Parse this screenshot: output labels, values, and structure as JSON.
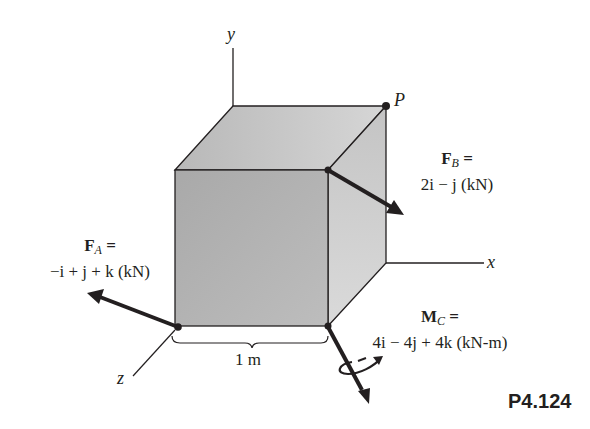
{
  "figure": {
    "label": "P4.124",
    "axes": {
      "y": "y",
      "x": "x",
      "z": "z"
    },
    "point_P": "P",
    "dimension": "1 m",
    "forces": [
      {
        "id": "F_A",
        "name": "F",
        "subscript": "A",
        "equals": "=",
        "expression": "−i + j + k (kN)"
      },
      {
        "id": "F_B",
        "name": "F",
        "subscript": "B",
        "equals": "=",
        "expression": "2i − j (kN)"
      }
    ],
    "moment": {
      "id": "M_C",
      "name": "M",
      "subscript": "C",
      "equals": "=",
      "expression": "4i − 4j + 4k (kN-m)"
    },
    "colors": {
      "ink": "#231f20",
      "cube_front": "#b3b3b3",
      "cube_top": "#c8c8c8",
      "cube_side": "#d0d0d0"
    }
  }
}
